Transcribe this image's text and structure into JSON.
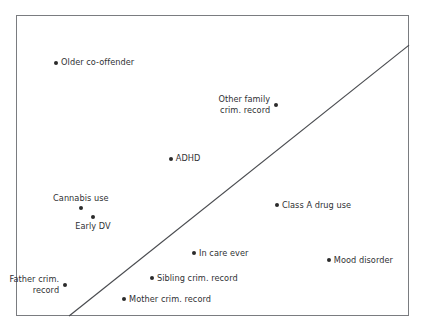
{
  "chart_data": {
    "type": "scatter",
    "title": "",
    "subtitle": "",
    "xlabel": "",
    "ylabel": "",
    "xlim": [
      0,
      100
    ],
    "ylim": [
      0,
      100
    ],
    "grid": false,
    "legend": null,
    "axis_ticks": {
      "x": [],
      "y": []
    },
    "marker_color": "#2b2b2b",
    "frame_color": "#7a7c80",
    "reference_line": {
      "label": "diagonal reference line",
      "style": "solid",
      "color": "#4a4c50",
      "x_start": 13.5,
      "y_start": 0,
      "x_end": 100,
      "y_end": 90
    },
    "points": [
      {
        "label": "Older co-offender",
        "label_lines": [
          "Older co-offender"
        ],
        "label_position": "right",
        "x": 10.2,
        "y": 84.1
      },
      {
        "label": "Other family crim. record",
        "label_lines": [
          "Other family",
          "crim. record"
        ],
        "label_position": "left-2line",
        "x": 66.2,
        "y": 70.1
      },
      {
        "label": "ADHD",
        "label_lines": [
          "ADHD"
        ],
        "label_position": "right",
        "x": 39.4,
        "y": 52.2
      },
      {
        "label": "Cannabis use",
        "label_lines": [
          "Cannabis use"
        ],
        "label_position": "above",
        "x": 16.5,
        "y": 35.9
      },
      {
        "label": "Class A drug use",
        "label_lines": [
          "Class A drug use"
        ],
        "label_position": "right",
        "x": 66.4,
        "y": 36.9
      },
      {
        "label": "Early DV",
        "label_lines": [
          "Early DV"
        ],
        "label_position": "below",
        "x": 19.6,
        "y": 32.9
      },
      {
        "label": "In care ever",
        "label_lines": [
          "In care ever"
        ],
        "label_position": "right",
        "x": 45.3,
        "y": 20.9
      },
      {
        "label": "Mood disorder",
        "label_lines": [
          "Mood disorder"
        ],
        "label_position": "right",
        "x": 79.6,
        "y": 18.6
      },
      {
        "label": "Father crim. record",
        "label_lines": [
          "Father crim.",
          "record"
        ],
        "label_position": "left-2line",
        "x": 12.5,
        "y": 10.3
      },
      {
        "label": "Sibling crim. record",
        "label_lines": [
          "Sibling crim. record"
        ],
        "label_position": "right",
        "x": 34.6,
        "y": 12.6
      },
      {
        "label": "Mother crim. record",
        "label_lines": [
          "Mother crim. record"
        ],
        "label_position": "right",
        "x": 27.5,
        "y": 5.6
      }
    ]
  }
}
